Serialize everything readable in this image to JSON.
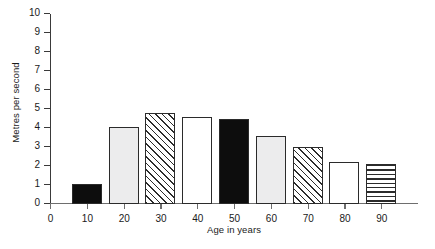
{
  "chart_data": {
    "type": "bar",
    "title": "",
    "xlabel": "Age in years",
    "ylabel": "Metres per second",
    "categories": [
      "10",
      "20",
      "30",
      "40",
      "50",
      "60",
      "70",
      "80",
      "90"
    ],
    "values": [
      1.05,
      4.05,
      4.8,
      4.6,
      4.5,
      3.6,
      3.0,
      2.2,
      2.1
    ],
    "series": [
      {
        "name": "Walking speed",
        "values": [
          1.05,
          4.05,
          4.8,
          4.6,
          4.5,
          3.6,
          3.0,
          2.2,
          2.1
        ]
      }
    ],
    "bar_fills": [
      "solid-black",
      "light-gray",
      "diagonal-hatch",
      "white",
      "solid-black",
      "light-gray",
      "diagonal-hatch",
      "white",
      "horizontal-hatch"
    ],
    "xlim": [
      0,
      100
    ],
    "ylim": [
      0,
      10
    ],
    "x_ticks": [
      "0",
      "10",
      "20",
      "30",
      "40",
      "50",
      "60",
      "70",
      "80",
      "90"
    ],
    "y_ticks": [
      "0",
      "1",
      "2",
      "3",
      "4",
      "5",
      "6",
      "7",
      "8",
      "9",
      "10"
    ],
    "grid": false,
    "legend": "none",
    "axis_color": "#3a3a3a",
    "bar_edge_color": "#2b2b2b"
  },
  "axes": {
    "y_title": "Metres per second",
    "x_title": "Age in years"
  }
}
